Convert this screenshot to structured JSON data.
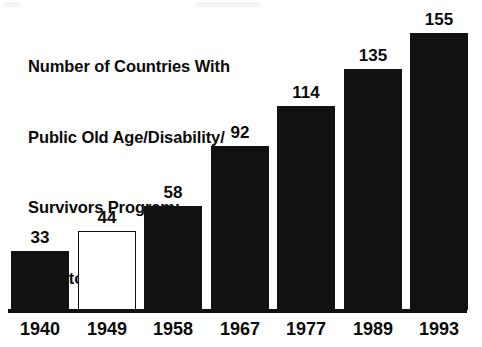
{
  "chart_data": {
    "type": "bar",
    "title_lines": [
      "Number of Countries With",
      "Public Old Age/Disability/",
      "Survivors Program:",
      "1940 to 1993"
    ],
    "xlabel": "",
    "ylabel": "",
    "categories": [
      "1940",
      "1949",
      "1958",
      "1967",
      "1977",
      "1989",
      "1993"
    ],
    "values": [
      33,
      44,
      58,
      92,
      114,
      135,
      155
    ],
    "value_labels": [
      "33",
      "44",
      "58",
      "92",
      "114",
      "135",
      "155"
    ],
    "bar_styles": [
      "filled",
      "hollow",
      "filled",
      "filled",
      "filled",
      "filled",
      "filled"
    ],
    "ylim": [
      0,
      155
    ],
    "grid": false,
    "legend": null,
    "axis_line": "baseline-only",
    "colors": {
      "bar_fill": "#111111",
      "bar_outline": "#111111",
      "hollow_fill": "#ffffff",
      "text": "#0b0b0b",
      "background": "#ffffff"
    }
  }
}
